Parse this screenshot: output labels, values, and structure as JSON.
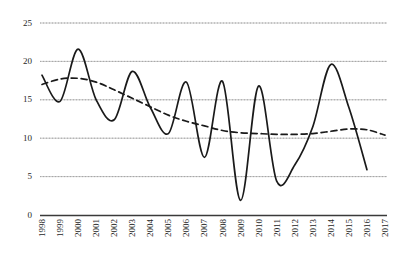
{
  "chart_data": {
    "type": "line",
    "title": "",
    "xlabel": "",
    "ylabel": "",
    "ylim": [
      0,
      25
    ],
    "ytick_values": [
      0,
      5,
      10,
      15,
      20,
      25
    ],
    "ytick_labels": [
      "0",
      "5",
      "10",
      "15",
      "20",
      "25"
    ],
    "grid": true,
    "legend": "none",
    "categories": [
      "1998",
      "1999",
      "2000",
      "2001",
      "2002",
      "2003",
      "2004",
      "2005",
      "2006",
      "2007",
      "2008",
      "2009",
      "2010",
      "2011",
      "2012",
      "2013",
      "2014",
      "2015",
      "2016",
      "2017"
    ],
    "series": [
      {
        "name": "annual series",
        "style": "solid",
        "color": "#1a1a1a",
        "smoothing": "spline",
        "values": [
          18.2,
          14.8,
          21.6,
          15.0,
          12.4,
          18.7,
          14.0,
          10.6,
          17.3,
          7.5,
          17.4,
          1.9,
          16.8,
          4.4,
          6.5,
          11.5,
          19.6,
          14.0,
          5.9,
          null
        ]
      },
      {
        "name": "trend",
        "style": "dashed",
        "color": "#1a1a1a",
        "smoothing": "spline",
        "values": [
          17.0,
          17.7,
          17.8,
          17.3,
          16.3,
          15.2,
          14.1,
          13.0,
          12.2,
          11.6,
          11.0,
          10.7,
          10.6,
          10.5,
          10.5,
          10.6,
          10.9,
          11.2,
          11.1,
          10.4
        ]
      }
    ]
  },
  "axes": {
    "y_axis_name": "value-axis",
    "x_axis_name": "year-axis"
  }
}
